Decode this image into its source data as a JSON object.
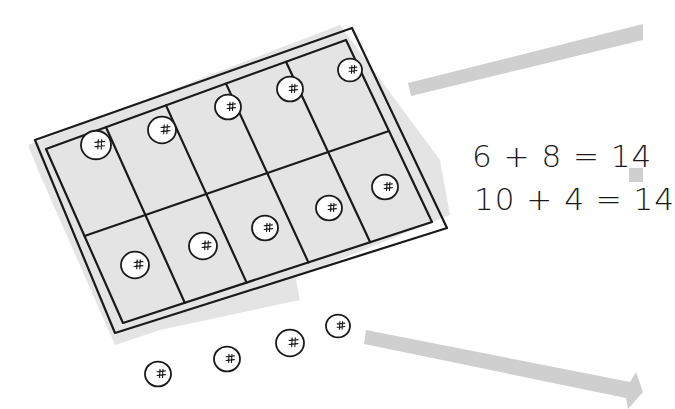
{
  "diagram": {
    "type": "ten-frame",
    "colors": {
      "ink": "#1a1a1a",
      "shadow": "#e4e4e4",
      "arrow": "#cfcfcf",
      "background": "#ffffff"
    },
    "ten_frame": {
      "rows": 2,
      "columns": 5,
      "filled_cells": 10,
      "outer_corners": [
        [
          35,
          140
        ],
        [
          352,
          28
        ],
        [
          447,
          228
        ],
        [
          115,
          333
        ]
      ],
      "inner_corners": [
        [
          46,
          149
        ],
        [
          346,
          40
        ],
        [
          432,
          222
        ],
        [
          123,
          323
        ]
      ]
    },
    "berries_in_frame": [
      {
        "cx": 96,
        "cy": 145,
        "r": 15
      },
      {
        "cx": 162,
        "cy": 130,
        "r": 14
      },
      {
        "cx": 228,
        "cy": 107,
        "r": 13
      },
      {
        "cx": 290,
        "cy": 89,
        "r": 13
      },
      {
        "cx": 350,
        "cy": 70,
        "r": 12
      },
      {
        "cx": 135,
        "cy": 265,
        "r": 14
      },
      {
        "cx": 203,
        "cy": 246,
        "r": 14
      },
      {
        "cx": 265,
        "cy": 228,
        "r": 13
      },
      {
        "cx": 329,
        "cy": 208,
        "r": 13
      },
      {
        "cx": 385,
        "cy": 187,
        "r": 13
      }
    ],
    "loose_berries": [
      {
        "cx": 158,
        "cy": 374,
        "r": 13
      },
      {
        "cx": 227,
        "cy": 359,
        "r": 13
      },
      {
        "cx": 290,
        "cy": 343,
        "r": 14
      },
      {
        "cx": 338,
        "cy": 326,
        "r": 12
      }
    ],
    "counts": {
      "in_frame": 10,
      "loose": 4,
      "total": 14
    }
  },
  "equations": [
    {
      "text": "6 + 8 = 14",
      "addend_a": 6,
      "addend_b": 8,
      "sum": 14
    },
    {
      "text": "10 + 4 = 14",
      "addend_a": 10,
      "addend_b": 4,
      "sum": 14
    }
  ],
  "arrows": [
    {
      "name": "top-arrow",
      "direction": "right"
    },
    {
      "name": "middle-arrow",
      "direction": "right"
    },
    {
      "name": "bottom-arrow",
      "direction": "right"
    }
  ]
}
